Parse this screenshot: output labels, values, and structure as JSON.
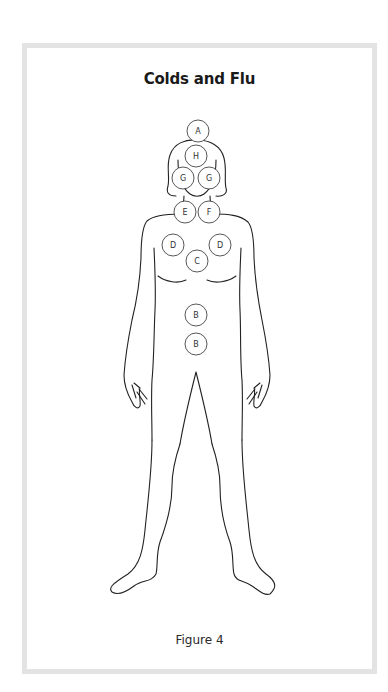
{
  "figure": {
    "title": "Colds and Flu",
    "caption": "Figure 4"
  },
  "points": [
    {
      "label": "A",
      "region": "crown-of-head"
    },
    {
      "label": "H",
      "region": "forehead"
    },
    {
      "label": "G",
      "region": "left-cheek"
    },
    {
      "label": "G",
      "region": "right-cheek"
    },
    {
      "label": "E",
      "region": "left-throat"
    },
    {
      "label": "F",
      "region": "right-throat"
    },
    {
      "label": "D",
      "region": "left-chest"
    },
    {
      "label": "D",
      "region": "right-chest"
    },
    {
      "label": "C",
      "region": "sternum"
    },
    {
      "label": "B",
      "region": "upper-abdomen"
    },
    {
      "label": "B",
      "region": "lower-abdomen"
    }
  ],
  "colors": {
    "frame": "#e3e3e3",
    "outline": "#222222",
    "text": "#1a1a1a"
  }
}
